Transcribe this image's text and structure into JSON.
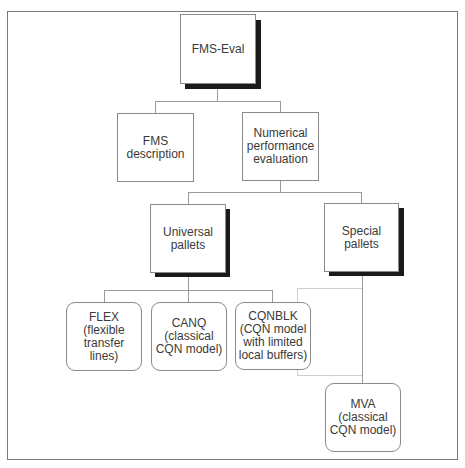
{
  "diagram": {
    "type": "hierarchy",
    "root": {
      "label": "FMS-Eval",
      "children": [
        {
          "label": "FMS\ndescription"
        },
        {
          "label": "Numerical\nperformance\nevaluation",
          "children": [
            {
              "label": "Universal\npallets",
              "children": [
                {
                  "label": "FLEX\n(flexible\ntransfer\nlines)"
                },
                {
                  "label": "CANQ\n(classical\nCQN model)"
                },
                {
                  "label": "CQNBLK\n(CQN model\nwith limited\nlocal buffers)"
                }
              ]
            },
            {
              "label": "Special\npallets",
              "children": [
                {
                  "label": "MVA\n(classical\nCQN model)"
                }
              ]
            }
          ]
        }
      ]
    }
  },
  "nodes": {
    "fms_eval": "FMS-Eval",
    "fms_description": "FMS\ndescription",
    "numerical": "Numerical\nperformance\nevaluation",
    "universal": "Universal\npallets",
    "special": "Special\npallets",
    "flex": "FLEX\n(flexible\ntransfer\nlines)",
    "canq": "CANQ\n(classical\nCQN model)",
    "cqnblk": "CQNBLK\n(CQN model\nwith limited\nlocal buffers)",
    "mva": "MVA\n(classical\nCQN model)"
  }
}
